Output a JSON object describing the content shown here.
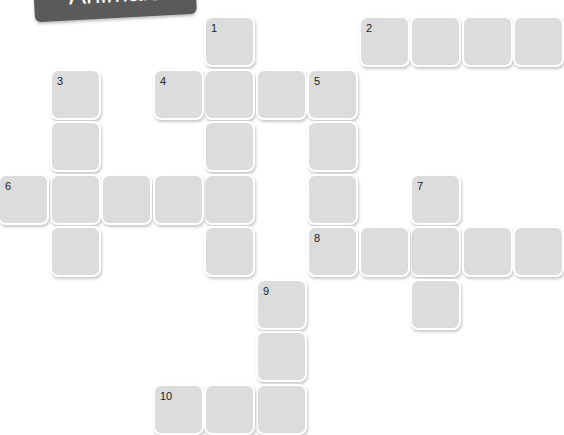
{
  "title": "Animals",
  "colors": {
    "cell": "#dcdcdc",
    "banner": "#5a5a5a",
    "border": "#ffffff"
  },
  "grid": {
    "col_pitch": 51.5,
    "row_pitch": 52.5,
    "origin_x": 0,
    "origin_y": 18
  },
  "words": [
    {
      "number": "1",
      "direction": "down",
      "col": 4,
      "row": 0,
      "length": 5
    },
    {
      "number": "2",
      "direction": "across",
      "col": 7,
      "row": 0,
      "length": 4
    },
    {
      "number": "3",
      "direction": "down",
      "col": 1,
      "row": 1,
      "length": 4
    },
    {
      "number": "4",
      "direction": "across",
      "col": 3,
      "row": 1,
      "length": 4
    },
    {
      "number": "5",
      "direction": "down",
      "col": 6,
      "row": 1,
      "length": 4
    },
    {
      "number": "6",
      "direction": "across",
      "col": 0,
      "row": 3,
      "length": 5
    },
    {
      "number": "7",
      "direction": "down",
      "col": 8,
      "row": 3,
      "length": 3
    },
    {
      "number": "8",
      "direction": "across",
      "col": 6,
      "row": 4,
      "length": 5
    },
    {
      "number": "9",
      "direction": "down",
      "col": 5,
      "row": 5,
      "length": 3
    },
    {
      "number": "10",
      "direction": "across",
      "col": 3,
      "row": 7,
      "length": 3
    }
  ]
}
